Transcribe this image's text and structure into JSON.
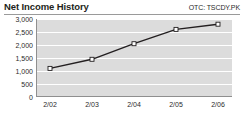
{
  "header": {
    "title": "Net Income History",
    "ticker": "OTC: TSCDY.PK"
  },
  "chart_data": {
    "type": "line",
    "title": "Net Income History",
    "subtitle": "OTC: TSCDY.PK",
    "xlabel": "",
    "ylabel": "",
    "categories": [
      "2/02",
      "2/03",
      "2/04",
      "2/05",
      "2/06"
    ],
    "values": [
      1100,
      1450,
      2050,
      2600,
      2800
    ],
    "series": [
      {
        "name": "Net Income",
        "values": [
          1100,
          1450,
          2050,
          2600,
          2800
        ]
      }
    ],
    "ylim": [
      0,
      3000
    ],
    "yticks": [
      0,
      500,
      1000,
      1500,
      2000,
      2500,
      3000
    ],
    "ytick_labels": [
      "0",
      "500",
      "1,000",
      "1,500",
      "2,000",
      "2,500",
      "3,000"
    ],
    "xtick_labels": [
      "2/02",
      "2/03",
      "2/04",
      "2/05",
      "2/06"
    ],
    "grid": true,
    "legend": false,
    "legend_position": "none",
    "colors": {
      "line": "#231f20",
      "marker_fill": "#ffffff",
      "marker_stroke": "#231f20",
      "plot_background": "#dcdcdc",
      "gridline": "#ffffff",
      "axis": "#8f8f8f",
      "text": "#231f20"
    }
  }
}
